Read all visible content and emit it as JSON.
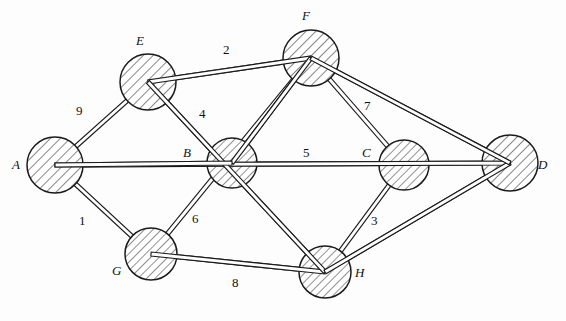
{
  "diagram": {
    "stroke_color": "#1a1a1a",
    "hatch_color": "#2b2b2b",
    "background": "#fdfdfd",
    "width": 566,
    "height": 321
  },
  "nodes": [
    {
      "id": "A",
      "label": "A",
      "cx": 55,
      "cy": 165,
      "r": 28,
      "label_x": 12,
      "label_y": 157
    },
    {
      "id": "B",
      "label": "B",
      "cx": 232,
      "cy": 163,
      "r": 25,
      "label_x": 183,
      "label_y": 145
    },
    {
      "id": "C",
      "label": "C",
      "cx": 404,
      "cy": 165,
      "r": 25,
      "label_x": 362,
      "label_y": 145
    },
    {
      "id": "D",
      "label": "D",
      "cx": 510,
      "cy": 163,
      "r": 28,
      "label_x": 538,
      "label_y": 157
    },
    {
      "id": "E",
      "label": "E",
      "cx": 148,
      "cy": 82,
      "r": 28,
      "label_x": 136,
      "label_y": 33
    },
    {
      "id": "F",
      "label": "F",
      "cx": 311,
      "cy": 58,
      "r": 28,
      "label_x": 302,
      "label_y": 8
    },
    {
      "id": "G",
      "label": "G",
      "cx": 151,
      "cy": 254,
      "r": 26,
      "label_x": 112,
      "label_y": 263
    },
    {
      "id": "H",
      "label": "H",
      "cx": 325,
      "cy": 272,
      "r": 26,
      "label_x": 355,
      "label_y": 265
    }
  ],
  "edges": [
    {
      "id": "E-F",
      "from": "E",
      "to": "F",
      "weight": "2",
      "label_x": 223,
      "label_y": 42
    },
    {
      "id": "A-E",
      "from": "A",
      "to": "E",
      "weight": "9",
      "label_x": 76,
      "label_y": 103
    },
    {
      "id": "E-H",
      "from": "E",
      "to": "H",
      "weight": "4",
      "label_x": 199,
      "label_y": 106
    },
    {
      "id": "A-G",
      "from": "A",
      "to": "G",
      "weight": "1",
      "label_x": 79,
      "label_y": 213
    },
    {
      "id": "G-F",
      "from": "G",
      "to": "F",
      "weight": "6",
      "label_x": 192,
      "label_y": 211
    },
    {
      "id": "A-D",
      "from": "A",
      "to": "D",
      "weight": "5",
      "label_x": 303,
      "label_y": 145
    },
    {
      "id": "F-C",
      "from": "F",
      "to": "C",
      "weight": "7",
      "label_x": 364,
      "label_y": 98
    },
    {
      "id": "C-H",
      "from": "C",
      "to": "H",
      "weight": "3",
      "label_x": 371,
      "label_y": 213
    },
    {
      "id": "G-H",
      "from": "G",
      "to": "H",
      "weight": "8",
      "label_x": 232,
      "label_y": 275
    },
    {
      "id": "F-D",
      "from": "F",
      "to": "D",
      "weight": "",
      "label_x": 0,
      "label_y": 0
    },
    {
      "id": "H-D",
      "from": "H",
      "to": "D",
      "weight": "",
      "label_x": 0,
      "label_y": 0
    },
    {
      "id": "B-F",
      "from": "B",
      "to": "F",
      "weight": "",
      "label_x": 0,
      "label_y": 0
    },
    {
      "id": "B-A",
      "from": "B",
      "to": "A",
      "weight": "",
      "label_x": 0,
      "label_y": 0
    }
  ],
  "edge_geometry": [
    {
      "id": "E-F",
      "x1": 148,
      "y1": 82,
      "x2": 311,
      "y2": 58,
      "curve": 0
    },
    {
      "id": "A-E",
      "x1": 55,
      "y1": 165,
      "x2": 148,
      "y2": 82,
      "curve": 0
    },
    {
      "id": "E-H",
      "x1": 148,
      "y1": 82,
      "x2": 325,
      "y2": 272,
      "curve": 0
    },
    {
      "id": "A-G",
      "x1": 55,
      "y1": 165,
      "x2": 151,
      "y2": 254,
      "curve": 0
    },
    {
      "id": "G-F",
      "x1": 151,
      "y1": 254,
      "x2": 311,
      "y2": 58,
      "curve": 0
    },
    {
      "id": "A-D",
      "x1": 55,
      "y1": 165,
      "x2": 510,
      "y2": 163,
      "curve": 0
    },
    {
      "id": "F-C",
      "x1": 311,
      "y1": 58,
      "x2": 404,
      "y2": 165,
      "curve": 0
    },
    {
      "id": "C-H",
      "x1": 404,
      "y1": 165,
      "x2": 325,
      "y2": 272,
      "curve": 0
    },
    {
      "id": "G-H",
      "x1": 151,
      "y1": 254,
      "x2": 325,
      "y2": 272,
      "curve": 0
    },
    {
      "id": "F-D",
      "x1": 311,
      "y1": 58,
      "x2": 510,
      "y2": 163,
      "curve": 0
    },
    {
      "id": "H-D",
      "x1": 325,
      "y1": 272,
      "x2": 510,
      "y2": 163,
      "curve": 0
    },
    {
      "id": "B-F",
      "x1": 232,
      "y1": 163,
      "x2": 311,
      "y2": 58,
      "curve": 0
    },
    {
      "id": "B-A",
      "x1": 232,
      "y1": 163,
      "x2": 55,
      "y2": 165,
      "curve": 0
    }
  ]
}
